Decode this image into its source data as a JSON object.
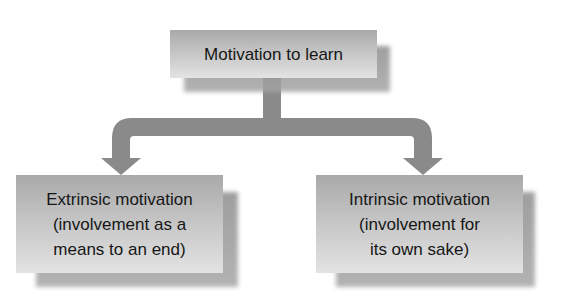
{
  "diagram": {
    "root": {
      "label": "Motivation to learn"
    },
    "children": [
      {
        "id": "extrinsic",
        "label": "Extrinsic motivation\n(involvement as a\nmeans to an end)"
      },
      {
        "id": "intrinsic",
        "label": "Intrinsic motivation\n(involvement for\nits own sake)"
      }
    ],
    "edges": [
      {
        "from": "root",
        "to": "extrinsic"
      },
      {
        "from": "root",
        "to": "intrinsic"
      }
    ],
    "colors": {
      "box_top": "#a9a9a9",
      "box_bottom": "#e3e3e3",
      "arrow": "#8a8a8a",
      "text": "#161616",
      "background": "#ffffff"
    }
  }
}
